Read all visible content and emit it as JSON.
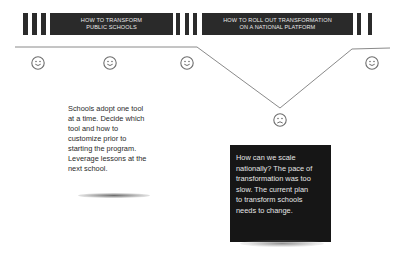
{
  "phases": [
    {
      "title_line1": "HOW TO TRANSFORM",
      "title_line2": "PUBLIC SCHOOLS"
    },
    {
      "title_line1": "HOW TO ROLL OUT  TRANSFORMATION",
      "title_line2": "ON A NATIONAL PLATFORM"
    }
  ],
  "moods": [
    {
      "icon": "smiley-happy-icon",
      "position": "start"
    },
    {
      "icon": "smiley-happy-icon",
      "position": "phase1-mid"
    },
    {
      "icon": "smiley-happy-icon",
      "position": "phase1-end"
    },
    {
      "icon": "smiley-sad-icon",
      "position": "phase2-low"
    },
    {
      "icon": "smiley-happy-icon",
      "position": "end"
    }
  ],
  "notes": {
    "phase1": "Schools adopt one tool at a time. Decide which tool and how to customize prior to starting the program. Leverage lessons at the next school.",
    "phase2_lines": [
      "How can we scale",
      "nationally? The pace of",
      "transformation was too",
      "slow. The current plan",
      "to transform schools",
      "needs to change."
    ],
    "phase1_lines": [
      "Schools adopt one tool",
      "at a time. Decide which",
      "tool and how to",
      "customize prior to",
      "starting the program.",
      "Leverage lessons at the",
      "next school."
    ]
  },
  "colors": {
    "banner_bg": "#2a2a2a",
    "banner_text": "#e8e8e8",
    "line": "#8a8a8a",
    "face": "#6e6e6e",
    "dark_card": "#161616"
  }
}
